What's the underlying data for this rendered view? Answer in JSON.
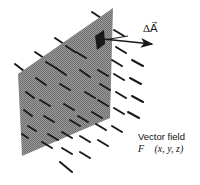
{
  "figure": {
    "area_label": "ΔA⃗",
    "field_title": "Vector field",
    "field_function": "F⃗ (x, y, z)",
    "colors": {
      "surface": "#8a8a8a",
      "surface_patch": "#1a1a1a",
      "vector": "#1a1a1a",
      "background": "#ffffff"
    },
    "surface_polygon": [
      [
        113,
        8
      ],
      [
        110,
        118
      ],
      [
        22,
        156
      ],
      [
        18,
        74
      ]
    ],
    "patch_polygon": [
      [
        104,
        30
      ],
      [
        105,
        44
      ],
      [
        97,
        50
      ],
      [
        95,
        36
      ]
    ],
    "normal_arrow": {
      "from": [
        103,
        39
      ],
      "to": [
        153,
        44
      ]
    },
    "field_vectors_direction": "down-right"
  }
}
